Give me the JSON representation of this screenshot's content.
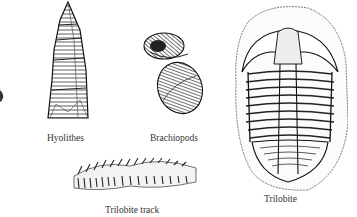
{
  "figure": {
    "background": "#ffffff",
    "ink_color": "#222222",
    "specimens": [
      {
        "id": "hyolithes",
        "label": "Hyolithes"
      },
      {
        "id": "brachiopods",
        "label": "Brachiopods"
      },
      {
        "id": "trilobite-track",
        "label": "Trilobite track"
      },
      {
        "id": "trilobite",
        "label": "Trilobite"
      }
    ]
  }
}
